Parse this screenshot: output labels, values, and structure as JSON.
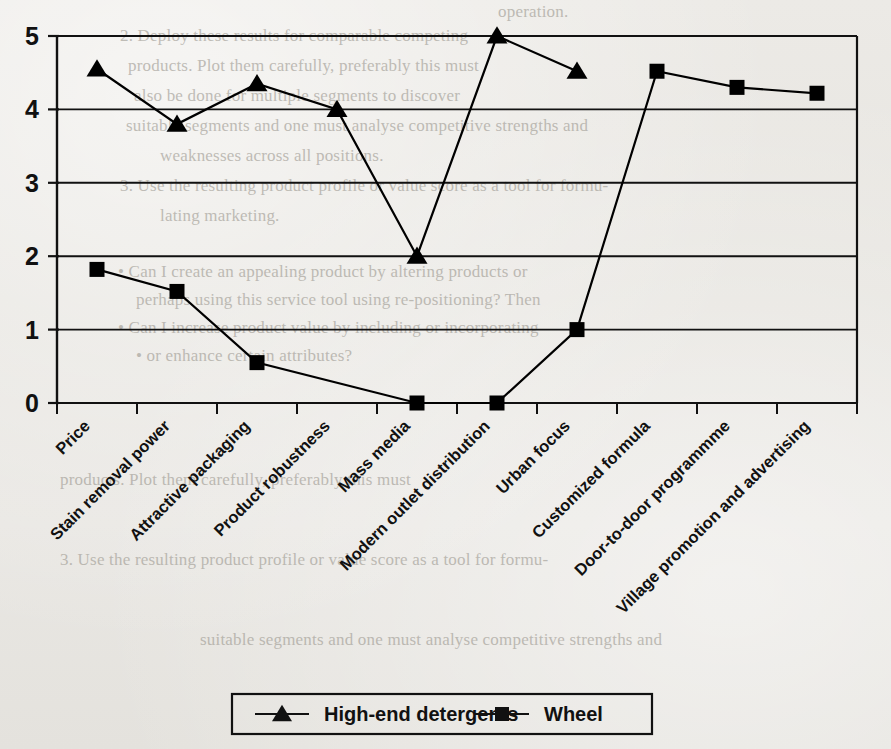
{
  "chart_data": {
    "type": "line",
    "title": "",
    "xlabel": "",
    "ylabel": "",
    "ylim": [
      0,
      5
    ],
    "ytick_labels": [
      "0",
      "1",
      "2",
      "3",
      "4",
      "5"
    ],
    "grid": true,
    "legend_position": "bottom-center",
    "categories": [
      "Price",
      "Stain removal power",
      "Attractive packaging",
      "Product robustness",
      "Mass media",
      "Modern outlet distribution",
      "Urban focus",
      "Customized formula",
      "Door-to-door programmme",
      "Village promotion and advertising"
    ],
    "series": [
      {
        "name": "High-end detergents",
        "marker": "triangle",
        "color": "#000000",
        "values": [
          4.55,
          3.8,
          4.35,
          4.0,
          2.0,
          5.0,
          4.52,
          null,
          null,
          null
        ]
      },
      {
        "name": "Wheel",
        "marker": "square",
        "color": "#000000",
        "values": [
          1.82,
          1.52,
          0.55,
          null,
          0.0,
          0.0,
          1.0,
          4.52,
          4.3,
          4.22
        ]
      }
    ]
  },
  "legend": {
    "items": [
      {
        "label": "High-end detergents",
        "marker": "triangle"
      },
      {
        "label": "Wheel",
        "marker": "square"
      }
    ]
  },
  "background_text": {
    "lines": [
      "operation.",
      "2. Deploy these results for comparable competing",
      "products. Plot them carefully, preferably this must",
      "also be done for multiple segments to discover",
      "suitable segments and one must analyse competitive strengths and",
      "weaknesses across all positions.",
      "3. Use the resulting product profile or value score as a tool for formu-",
      "lating marketing.",
      "• Can I create an appealing product by altering products or",
      "perhaps using this service tool using re-positioning? Then",
      "• Can I increase product value by including or incorporating",
      "• or enhance certain attributes?"
    ]
  }
}
